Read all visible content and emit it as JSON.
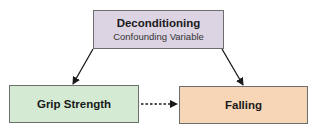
{
  "nodes": {
    "confounder": {
      "title": "Deconditioning",
      "subtitle": "Confounding Variable",
      "fill": "#ddd4e3"
    },
    "exposure": {
      "title": "Grip Strength",
      "fill": "#d4ead3"
    },
    "outcome": {
      "title": "Falling",
      "fill": "#f7d6b8"
    }
  },
  "edges": [
    {
      "from": "Deconditioning",
      "to": "Grip Strength",
      "style": "solid"
    },
    {
      "from": "Deconditioning",
      "to": "Falling",
      "style": "solid"
    },
    {
      "from": "Grip Strength",
      "to": "Falling",
      "style": "dashed"
    }
  ]
}
